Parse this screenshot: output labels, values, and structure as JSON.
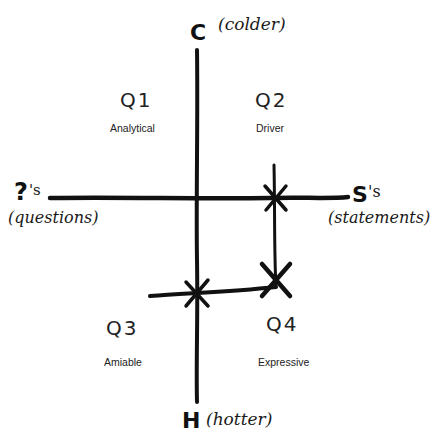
{
  "axes": {
    "top": {
      "letter": "C",
      "note": "(colder)"
    },
    "bottom": {
      "letter": "H",
      "note": "(hotter)"
    },
    "left": {
      "letter": "?",
      "suffix": "'s",
      "note": "(questions)"
    },
    "right": {
      "letter": "S",
      "suffix": "'s",
      "note": "(statements)"
    }
  },
  "quadrants": [
    {
      "id": "Q1",
      "label": "Q1",
      "type": "Analytical"
    },
    {
      "id": "Q2",
      "label": "Q2",
      "type": "Driver"
    },
    {
      "id": "Q3",
      "label": "Q3",
      "type": "Amiable"
    },
    {
      "id": "Q4",
      "label": "Q4",
      "type": "Expressive"
    }
  ],
  "colors": {
    "ink": "#111111",
    "background": "#ffffff"
  }
}
